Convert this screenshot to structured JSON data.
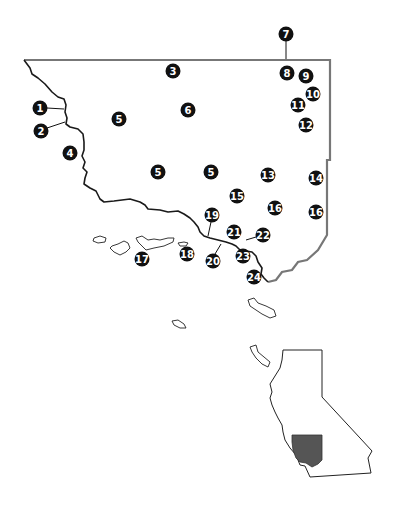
{
  "map": {
    "description": "Regional locator map with numbered site markers and California inset",
    "colors": {
      "marker_fill": "#111111",
      "marker_text": "#ffffff",
      "coastline": "#1a1a1a",
      "land_border": "#777777",
      "inset_highlight": "#555555"
    },
    "markers": [
      {
        "id": "m1",
        "label": "1"
      },
      {
        "id": "m2",
        "label": "2"
      },
      {
        "id": "m3",
        "label": "3"
      },
      {
        "id": "m4",
        "label": "4"
      },
      {
        "id": "m5a",
        "label": "5"
      },
      {
        "id": "m6",
        "label": "6"
      },
      {
        "id": "m5b",
        "label": "5"
      },
      {
        "id": "m5c",
        "label": "5"
      },
      {
        "id": "m7",
        "label": "7"
      },
      {
        "id": "m8",
        "label": "8"
      },
      {
        "id": "m9",
        "label": "9"
      },
      {
        "id": "m10",
        "label": "10"
      },
      {
        "id": "m11",
        "label": "11"
      },
      {
        "id": "m12",
        "label": "12"
      },
      {
        "id": "m13",
        "label": "13"
      },
      {
        "id": "m14",
        "label": "14"
      },
      {
        "id": "m15",
        "label": "15"
      },
      {
        "id": "m16a",
        "label": "16"
      },
      {
        "id": "m16b",
        "label": "16"
      },
      {
        "id": "m17",
        "label": "17"
      },
      {
        "id": "m18",
        "label": "18"
      },
      {
        "id": "m19",
        "label": "19"
      },
      {
        "id": "m20",
        "label": "20"
      },
      {
        "id": "m21",
        "label": "21"
      },
      {
        "id": "m22",
        "label": "22"
      },
      {
        "id": "m23",
        "label": "23"
      },
      {
        "id": "m24",
        "label": "24"
      }
    ],
    "inset": {
      "name": "California locator inset",
      "highlighted_region": "Southern California study area"
    }
  }
}
